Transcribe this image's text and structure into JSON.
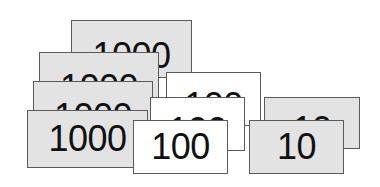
{
  "figure": {
    "colors": {
      "thousands_fill": "#e3e3e3",
      "hundreds_fill": "#ffffff",
      "tens_fill": "#e3e3e3",
      "border": "#5a5a5a",
      "text": "#111111"
    },
    "groups": [
      {
        "name": "thousands",
        "label": "1000",
        "count": 4,
        "cards": [
          {
            "label": "1000"
          },
          {
            "label": "1000"
          },
          {
            "label": "1000"
          },
          {
            "label": "1000"
          }
        ]
      },
      {
        "name": "hundreds",
        "label": "100",
        "count": 3,
        "cards": [
          {
            "label": "100"
          },
          {
            "label": "100"
          },
          {
            "label": "100"
          }
        ]
      },
      {
        "name": "tens",
        "label": "10",
        "count": 2,
        "cards": [
          {
            "label": "10"
          },
          {
            "label": "10"
          }
        ]
      }
    ]
  }
}
